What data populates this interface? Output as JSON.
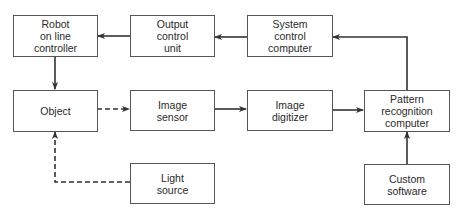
{
  "diagram": {
    "type": "block-diagram",
    "nodes": [
      {
        "id": "robot",
        "label": "Robot\non line\ncontroller"
      },
      {
        "id": "output",
        "label": "Output\ncontrol\nunit"
      },
      {
        "id": "system",
        "label": "System\ncontrol\ncomputer"
      },
      {
        "id": "object",
        "label": "Object"
      },
      {
        "id": "sensor",
        "label": "Image\nsensor"
      },
      {
        "id": "digitizer",
        "label": "Image\ndigitizer"
      },
      {
        "id": "pattern",
        "label": "Pattern\nrecognition\ncomputer"
      },
      {
        "id": "light",
        "label": "Light\nsource"
      },
      {
        "id": "software",
        "label": "Custom\nsoftware"
      }
    ],
    "edges": [
      {
        "from": "output",
        "to": "robot",
        "style": "solid"
      },
      {
        "from": "system",
        "to": "output",
        "style": "solid"
      },
      {
        "from": "pattern",
        "to": "system",
        "style": "solid"
      },
      {
        "from": "robot",
        "to": "object",
        "style": "solid"
      },
      {
        "from": "object",
        "to": "sensor",
        "style": "dashed"
      },
      {
        "from": "sensor",
        "to": "digitizer",
        "style": "solid"
      },
      {
        "from": "digitizer",
        "to": "pattern",
        "style": "solid"
      },
      {
        "from": "light",
        "to": "object",
        "style": "dashed"
      },
      {
        "from": "software",
        "to": "pattern",
        "style": "solid"
      }
    ]
  }
}
